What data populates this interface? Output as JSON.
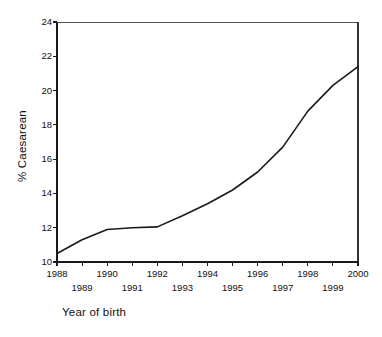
{
  "chart_data": {
    "type": "line",
    "title": "",
    "xlabel": "Year of birth",
    "ylabel": "% Caesarean",
    "x": [
      1988,
      1989,
      1990,
      1991,
      1992,
      1993,
      1994,
      1995,
      1996,
      1997,
      1998,
      1999,
      2000
    ],
    "values": [
      10.5,
      11.3,
      11.9,
      12.0,
      12.05,
      12.7,
      13.4,
      14.2,
      15.25,
      16.7,
      18.8,
      20.3,
      21.4
    ],
    "series": [
      {
        "name": "% Caesarean",
        "values": [
          10.5,
          11.3,
          11.9,
          12.0,
          12.05,
          12.7,
          13.4,
          14.2,
          15.25,
          16.7,
          18.8,
          20.3,
          21.4
        ]
      }
    ],
    "xlim": [
      1988,
      2000
    ],
    "ylim": [
      10,
      24
    ],
    "yticks": [
      10,
      12,
      14,
      16,
      18,
      20,
      22,
      24
    ],
    "ytick_labels": [
      "10",
      "12",
      "14",
      "16",
      "18",
      "20",
      "22",
      "24"
    ],
    "xticks": [
      1988,
      1989,
      1990,
      1991,
      1992,
      1993,
      1994,
      1995,
      1996,
      1997,
      1998,
      1999,
      2000
    ],
    "xtick_labels_upper": [
      "1988",
      "1990",
      "1992",
      "1994",
      "1996",
      "1998",
      "2000"
    ],
    "xtick_labels_lower": [
      "1989",
      "1991",
      "1993",
      "1995",
      "1997",
      "1999"
    ],
    "grid": false,
    "legend": false,
    "legend_position": "none",
    "line_color": "#1a1a1a",
    "axis_color": "#1a1a1a",
    "background_color": "#ffffff"
  },
  "axes": {
    "y_title": "% Caesarean",
    "x_title": "Year of birth"
  }
}
